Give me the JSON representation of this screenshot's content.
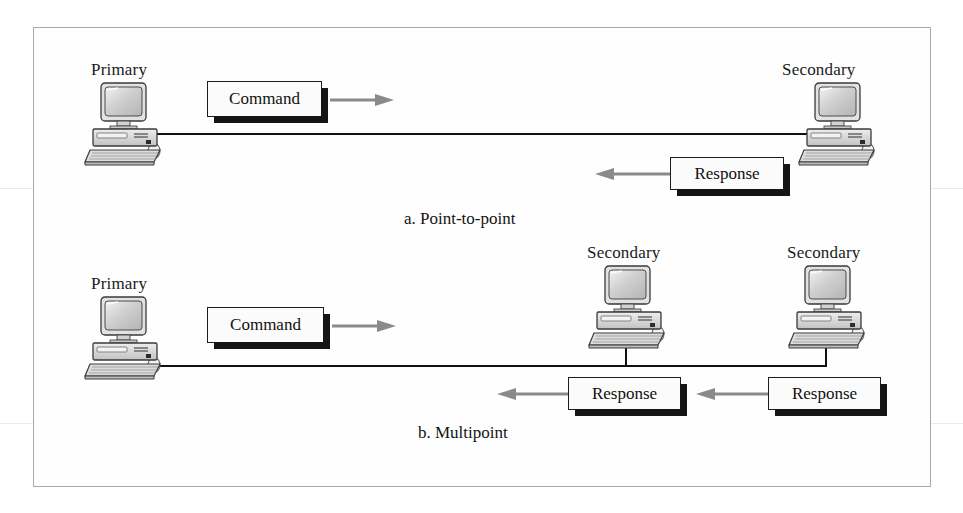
{
  "figure": {
    "type": "network-topology-diagram",
    "frame": {
      "border_color": "#a9a9a9",
      "background": "#fefefe"
    },
    "palette": {
      "wire": "#111111",
      "box_border": "#1c1c1c",
      "box_fill": "#fbfbfb",
      "box_shadow": "#151515",
      "arrow": "#8a8a8a",
      "text": "#141414",
      "monitor_screen": "#c9c9c9",
      "case_fill": "#d8d8d8"
    }
  },
  "panels": [
    {
      "id": "point-to-point",
      "caption": "a. Point-to-point",
      "nodes": [
        {
          "id": "p2p-primary",
          "label": "Primary",
          "role": "primary",
          "icon": "desktop-computer-icon"
        },
        {
          "id": "p2p-secondary",
          "label": "Secondary",
          "role": "secondary",
          "icon": "desktop-computer-icon"
        }
      ],
      "messages": [
        {
          "id": "p2p-command",
          "label": "Command",
          "direction": "right"
        },
        {
          "id": "p2p-response",
          "label": "Response",
          "direction": "left"
        }
      ],
      "link": "single point-to-point line"
    },
    {
      "id": "multipoint",
      "caption": "b. Multipoint",
      "nodes": [
        {
          "id": "mp-primary",
          "label": "Primary",
          "role": "primary",
          "icon": "desktop-computer-icon"
        },
        {
          "id": "mp-secondary-1",
          "label": "Secondary",
          "role": "secondary",
          "icon": "desktop-computer-icon"
        },
        {
          "id": "mp-secondary-2",
          "label": "Secondary",
          "role": "secondary",
          "icon": "desktop-computer-icon"
        }
      ],
      "messages": [
        {
          "id": "mp-command",
          "label": "Command",
          "direction": "right"
        },
        {
          "id": "mp-response-1",
          "label": "Response",
          "direction": "left"
        },
        {
          "id": "mp-response-2",
          "label": "Response",
          "direction": "left"
        }
      ],
      "link": "shared multipoint bus line"
    }
  ],
  "labels": {
    "primary": "Primary",
    "secondary": "Secondary",
    "command": "Command",
    "response": "Response",
    "caption_a": "a. Point-to-point",
    "caption_b": "b. Multipoint"
  }
}
